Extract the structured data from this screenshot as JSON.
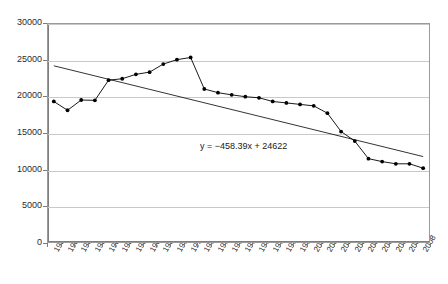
{
  "chart_data": {
    "type": "line",
    "title": "",
    "xlabel": "",
    "ylabel": "",
    "ylim": [
      0,
      30000
    ],
    "ytick_values": [
      0,
      5000,
      10000,
      15000,
      20000,
      25000,
      30000
    ],
    "ytick_labels": [
      "0",
      "5000",
      "10000",
      "15000",
      "20000",
      "25000",
      "30000"
    ],
    "grid": "horizontal",
    "legend": "none",
    "marker": "filled-diamond",
    "series_color": "#000000",
    "gridline_color": "#c9c9c9",
    "axis_color": "#7d7d7d",
    "background": "#ffffff",
    "categories": [
      "1981",
      "1982",
      "1983",
      "1984",
      "1985",
      "1986",
      "1987",
      "1988",
      "1989",
      "1990",
      "1991",
      "1992",
      "1993",
      "1994",
      "1995",
      "1996",
      "1997",
      "1998",
      "1999",
      "2000",
      "2001",
      "2002",
      "2003",
      "2004",
      "2005",
      "2006",
      "2007",
      "2008"
    ],
    "series": [
      {
        "name": "observed",
        "values": [
          19300,
          18100,
          19500,
          19450,
          22200,
          22400,
          23000,
          23300,
          24400,
          25000,
          25300,
          21000,
          20500,
          20200,
          19950,
          19800,
          19300,
          19100,
          18900,
          18700,
          17700,
          15200,
          13900,
          11500,
          11100,
          10800,
          10800,
          10200
        ]
      }
    ],
    "annotations": [
      {
        "name": "trendline-equation",
        "text": "y = −458.39x + 24622"
      }
    ],
    "trendline": {
      "type": "linear",
      "slope": -458.39,
      "intercept": 24622,
      "start_value": 24163,
      "end_value": 11786
    }
  }
}
